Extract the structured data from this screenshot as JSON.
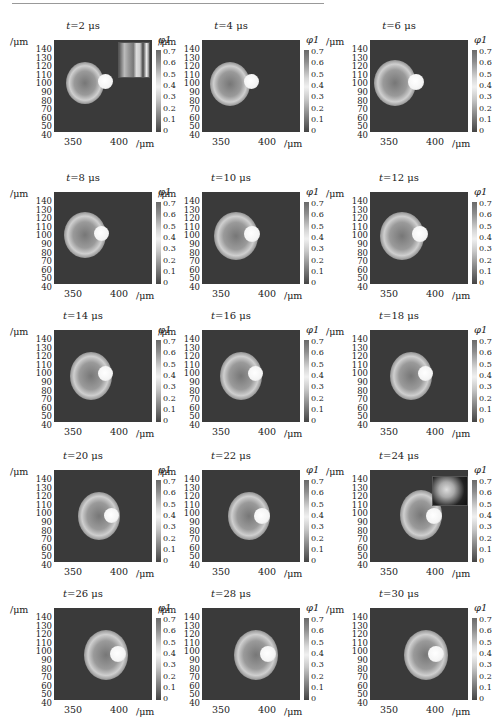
{
  "figure": {
    "rows": 5,
    "cols": 3,
    "y_axis_unit": "/μm",
    "x_axis_unit": "/μm",
    "colorbar_label": "φ1",
    "y_ticks": [
      "140",
      "130",
      "120",
      "110",
      "100",
      "90",
      "80",
      "70",
      "60",
      "50",
      "40"
    ],
    "x_ticks": [
      "350",
      "400"
    ],
    "colorbar_ticks": [
      "0.7",
      "0.6",
      "0.5",
      "0.4",
      "0.3",
      "0.2",
      "0.1",
      "0"
    ],
    "panels": [
      {
        "t_label": "t",
        "t_value": "=2 μs",
        "inset": "photo-inset"
      },
      {
        "t_label": "t",
        "t_value": "=4 μs"
      },
      {
        "t_label": "t",
        "t_value": "=6 μs"
      },
      {
        "t_label": "t",
        "t_value": "=8 μs"
      },
      {
        "t_label": "t",
        "t_value": "=10 μs"
      },
      {
        "t_label": "t",
        "t_value": "=12 μs"
      },
      {
        "t_label": "t",
        "t_value": "=14 μs"
      },
      {
        "t_label": "t",
        "t_value": "=16 μs"
      },
      {
        "t_label": "t",
        "t_value": "=18 μs"
      },
      {
        "t_label": "t",
        "t_value": "=20 μs"
      },
      {
        "t_label": "t",
        "t_value": "=22 μs"
      },
      {
        "t_label": "t",
        "t_value": "=24 μs",
        "inset": "photo-inset"
      },
      {
        "t_label": "t",
        "t_value": "=26 μs"
      },
      {
        "t_label": "t",
        "t_value": "=28 μs"
      },
      {
        "t_label": "t",
        "t_value": "=30 μs"
      }
    ]
  },
  "chart_data": {
    "type": "heatmap",
    "xlabel": "/μm",
    "ylabel": "/μm",
    "x_ticks": [
      350,
      400
    ],
    "y_range": [
      40,
      145
    ],
    "y_ticks": [
      40,
      50,
      60,
      70,
      80,
      90,
      100,
      110,
      120,
      130,
      140
    ],
    "colorbar": {
      "label": "φ1",
      "range": [
        0,
        0.7
      ],
      "ticks": [
        0,
        0.1,
        0.2,
        0.3,
        0.4,
        0.5,
        0.6,
        0.7
      ]
    },
    "times_us": [
      2,
      4,
      6,
      8,
      10,
      12,
      14,
      16,
      18,
      20,
      22,
      24,
      26,
      28,
      30
    ],
    "grid": false
  }
}
